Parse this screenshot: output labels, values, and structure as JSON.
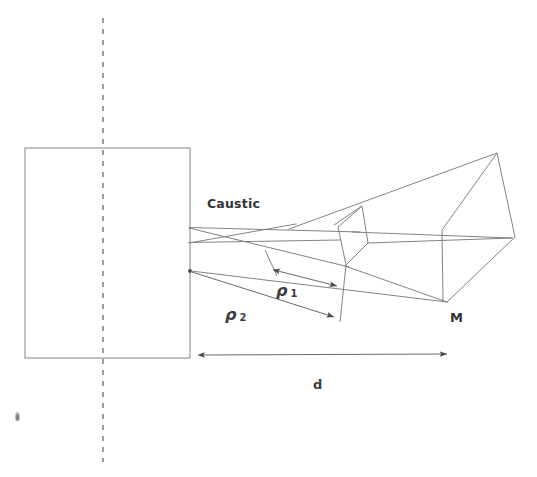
{
  "figure": {
    "kind": "optics-ray-diagram",
    "background_color": "#ffffff",
    "ink_color": "#5a5a5a",
    "text_color": "#333333",
    "width": 537,
    "height": 477,
    "labels": {
      "caustic": "Caustic",
      "mirror": "M",
      "distance_d": "d",
      "rho1_symbol": "ρ",
      "rho1_subscript": "1",
      "rho2_symbol": "ρ",
      "rho2_subscript": "2"
    },
    "aperture_rect": {
      "name": "source-aperture-rectangle",
      "x": 25,
      "y": 148,
      "width": 165,
      "height": 210
    },
    "optical_axis": {
      "name": "optical-axis-dashed-line",
      "x": 103,
      "y1": 18,
      "y2": 462,
      "dash": "5 6"
    },
    "dimension_d": {
      "name": "dimension-line-d",
      "x1": 198,
      "x2": 448,
      "y": 355,
      "arrows": "both"
    },
    "dimension_rho1": {
      "name": "dimension-line-rho1",
      "x1": 272,
      "y1": 269,
      "x2": 337,
      "y2": 285,
      "arrows": "both"
    },
    "dimension_rho2": {
      "name": "dimension-line-rho2",
      "x1": 191,
      "y1": 271,
      "x2": 334,
      "y2": 317,
      "arrows": "end"
    },
    "caustic_rays": [
      {
        "name": "ray-upper-axis",
        "x1": 189,
        "y1": 228,
        "x2": 512,
        "y2": 238
      },
      {
        "name": "ray-lower-axis",
        "x1": 189,
        "y1": 242,
        "x2": 512,
        "y2": 238
      },
      {
        "name": "ray-crossing-upper",
        "x1": 189,
        "y1": 228,
        "x2": 345,
        "y2": 266
      },
      {
        "name": "ray-crossing-lower",
        "x1": 189,
        "y1": 243,
        "x2": 296,
        "y2": 225
      },
      {
        "name": "ray-to-apex",
        "x1": 290,
        "y1": 228,
        "x2": 497,
        "y2": 153
      },
      {
        "name": "ray-lower-long",
        "x1": 191,
        "y1": 271,
        "x2": 447,
        "y2": 302
      },
      {
        "name": "ray-caustic-top-edge",
        "x1": 189,
        "y1": 227,
        "x2": 352,
        "y2": 232
      }
    ],
    "mirror_wireframe": {
      "name": "mirror-wireframe-M",
      "vertices": {
        "apex_top": [
          497,
          153
        ],
        "right": [
          515,
          237
        ],
        "bottom": [
          447,
          302
        ],
        "front_top": [
          442,
          230
        ],
        "mid_upper": [
          362,
          206
        ],
        "mid_left": [
          338,
          227
        ],
        "mid_lower_right": [
          368,
          243
        ],
        "mid_bottom": [
          346,
          265
        ]
      }
    },
    "tick_marks": [
      {
        "name": "tick-rho1-upper",
        "x1": 266,
        "y1": 251,
        "x2": 277,
        "y2": 274
      },
      {
        "name": "tick-rho2-lower",
        "x1": 330,
        "y1": 296,
        "x2": 340,
        "y2": 322
      }
    ],
    "scan_artifact": {
      "name": "scan-smudge",
      "x": 15,
      "y": 412
    }
  }
}
